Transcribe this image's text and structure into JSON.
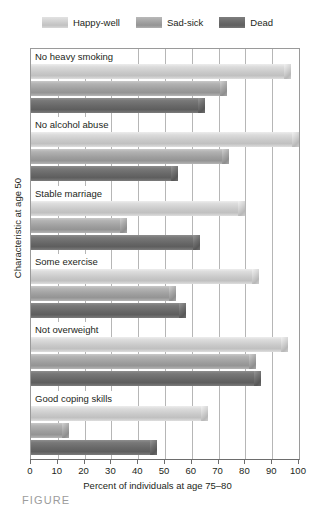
{
  "legend": {
    "items": [
      {
        "label": "Happy-well",
        "key": "happy",
        "color": "#cfcfcf",
        "icon": "legend-swatch-icon"
      },
      {
        "label": "Sad-sick",
        "key": "sad",
        "color": "#a2a2a2",
        "icon": "legend-swatch-icon"
      },
      {
        "label": "Dead",
        "key": "dead",
        "color": "#6a6a6a",
        "icon": "legend-swatch-icon"
      }
    ]
  },
  "axes": {
    "x_title": "Percent of individuals at age 75–80",
    "y_title": "Characteristic at age 50",
    "x_ticklabels": [
      "0",
      "10",
      "20",
      "30",
      "40",
      "50",
      "60",
      "70",
      "80",
      "90",
      "100"
    ]
  },
  "caption": "FIGURE",
  "chart_data": {
    "type": "bar",
    "orientation": "horizontal",
    "title": "",
    "xlabel": "Percent of individuals at age 75–80",
    "ylabel": "Characteristic at age 50",
    "xlim": [
      0,
      100
    ],
    "xticks": [
      0,
      10,
      20,
      30,
      40,
      50,
      60,
      70,
      80,
      90,
      100
    ],
    "grid": true,
    "legend_position": "top-center",
    "categories": [
      "No heavy smoking",
      "No alcohol abuse",
      "Stable marriage",
      "Some exercise",
      "Not overweight",
      "Good coping skills"
    ],
    "series": [
      {
        "name": "Happy-well",
        "color": "#cfcfcf",
        "values": [
          97,
          100,
          80,
          85,
          96,
          66
        ]
      },
      {
        "name": "Sad-sick",
        "color": "#a2a2a2",
        "values": [
          73,
          74,
          36,
          54,
          84,
          14
        ]
      },
      {
        "name": "Dead",
        "color": "#6a6a6a",
        "values": [
          65,
          55,
          63,
          58,
          86,
          47
        ]
      }
    ]
  }
}
